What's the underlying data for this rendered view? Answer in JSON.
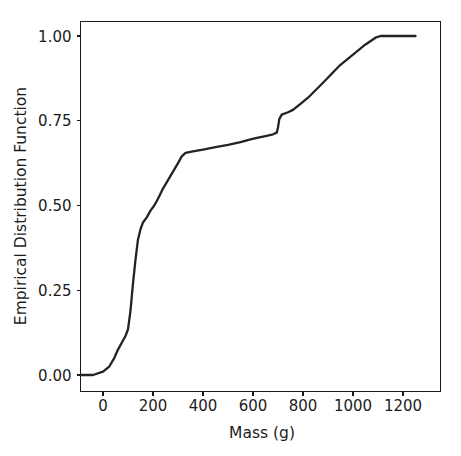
{
  "chart_data": {
    "type": "line",
    "title": "",
    "xlabel": "Mass (g)",
    "ylabel": "Empirical Distribution Function",
    "xlim": [
      -100,
      1260
    ],
    "ylim": [
      -0.02,
      1.06
    ],
    "xticks": [
      0,
      200,
      400,
      600,
      800,
      1000,
      1200
    ],
    "xticklabels": [
      "0",
      "200",
      "400",
      "600",
      "800",
      "1000",
      "1200"
    ],
    "yticks": [
      0.0,
      0.25,
      0.5,
      0.75,
      1.0
    ],
    "yticklabels": [
      "0.00",
      "0.25",
      "0.50",
      "0.75",
      "1.00"
    ],
    "grid": false,
    "legend": null,
    "series": [
      {
        "name": "Empirical Distribution Function",
        "color": "#232323",
        "x": [
          -90,
          -40,
          0,
          25,
          45,
          60,
          75,
          90,
          100,
          110,
          120,
          130,
          140,
          150,
          160,
          175,
          190,
          205,
          220,
          240,
          260,
          280,
          300,
          315,
          330,
          360,
          400,
          450,
          500,
          550,
          590,
          620,
          650,
          680,
          695,
          700,
          705,
          715,
          740,
          760,
          790,
          820,
          850,
          880,
          910,
          950,
          1000,
          1050,
          1090,
          1110,
          1150,
          1200,
          1250
        ],
        "y": [
          0.0,
          0.0,
          0.01,
          0.025,
          0.05,
          0.075,
          0.095,
          0.115,
          0.135,
          0.19,
          0.27,
          0.34,
          0.4,
          0.43,
          0.45,
          0.465,
          0.485,
          0.5,
          0.52,
          0.55,
          0.575,
          0.6,
          0.625,
          0.645,
          0.655,
          0.66,
          0.665,
          0.672,
          0.679,
          0.687,
          0.695,
          0.7,
          0.705,
          0.71,
          0.715,
          0.73,
          0.755,
          0.768,
          0.775,
          0.782,
          0.8,
          0.818,
          0.84,
          0.862,
          0.885,
          0.915,
          0.945,
          0.975,
          0.995,
          1.0,
          1.0,
          1.0,
          1.0
        ]
      }
    ]
  },
  "axes": {
    "x_title": "Mass (g)",
    "y_title": "Empirical Distribution Function"
  }
}
